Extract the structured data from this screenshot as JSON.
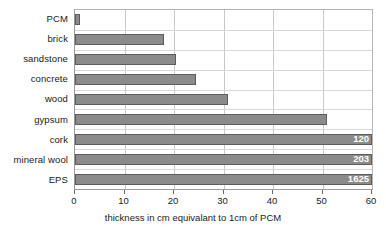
{
  "chart_data": {
    "type": "bar",
    "orientation": "horizontal",
    "title": "",
    "xlabel": "thickness in cm equivalant to 1cm of PCM",
    "ylabel": "",
    "xlim": [
      0,
      60
    ],
    "xticks": [
      0,
      10,
      20,
      30,
      40,
      50,
      60
    ],
    "grid": true,
    "legend": "none",
    "bar_color": "#8b8b8b",
    "bar_border_color": "#5d5d5d",
    "gridline_color": "#c8c8c8",
    "background_color": "#ffffff",
    "axis_color": "#9a9a9a",
    "text_color": "#1a1a1a",
    "value_label_color": "#ffffff",
    "categories": [
      "PCM",
      "brick",
      "sandstone",
      "concrete",
      "wood",
      "gypsum",
      "cork",
      "mineral wool",
      "EPS"
    ],
    "values": [
      1,
      18,
      20.5,
      24.5,
      31,
      51,
      120,
      203,
      1625
    ],
    "bars": [
      {
        "category": "PCM",
        "value": 1,
        "display_value": "",
        "clipped": false
      },
      {
        "category": "brick",
        "value": 18,
        "display_value": "",
        "clipped": false
      },
      {
        "category": "sandstone",
        "value": 20.5,
        "display_value": "",
        "clipped": false
      },
      {
        "category": "concrete",
        "value": 24.5,
        "display_value": "",
        "clipped": false
      },
      {
        "category": "wood",
        "value": 31,
        "display_value": "",
        "clipped": false
      },
      {
        "category": "gypsum",
        "value": 51,
        "display_value": "",
        "clipped": false
      },
      {
        "category": "cork",
        "value": 120,
        "display_value": "120",
        "clipped": true
      },
      {
        "category": "mineral wool",
        "value": 203,
        "display_value": "203",
        "clipped": true
      },
      {
        "category": "EPS",
        "value": 1625,
        "display_value": "1625",
        "clipped": true
      }
    ],
    "annotations": [
      {
        "text": "120",
        "category": "cork"
      },
      {
        "text": "203",
        "category": "mineral wool"
      },
      {
        "text": "1625",
        "category": "EPS"
      }
    ]
  }
}
